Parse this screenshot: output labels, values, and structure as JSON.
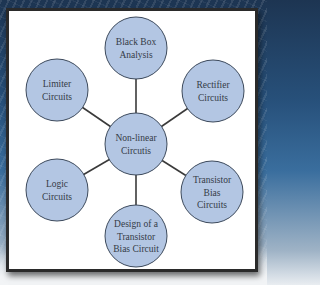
{
  "diagram": {
    "type": "hub-and-spoke",
    "center": {
      "id": "center",
      "lines": [
        "Non-linear",
        "Circutis"
      ]
    },
    "nodes": [
      {
        "id": "black-box-analysis",
        "lines": [
          "Black Box",
          "Analysis"
        ]
      },
      {
        "id": "rectifier-circuits",
        "lines": [
          "Rectifier",
          "Circuits"
        ]
      },
      {
        "id": "transistor-bias-circuits",
        "lines": [
          "Transistor",
          "Bias",
          "Circuits"
        ]
      },
      {
        "id": "design-transistor-bias-circuit",
        "lines": [
          "Design of a",
          "Transistor",
          "Bias Circuit"
        ]
      },
      {
        "id": "logic-circuits",
        "lines": [
          "Logic",
          "Circuits"
        ]
      },
      {
        "id": "limiter-circuits",
        "lines": [
          "Limiter",
          "Circuits"
        ]
      }
    ],
    "colors": {
      "node_fill": "#b3c6e3",
      "node_stroke": "#3d4a5c",
      "edge": "#3a3a3a",
      "text": "#333b46",
      "panel": "#ffffff"
    }
  }
}
